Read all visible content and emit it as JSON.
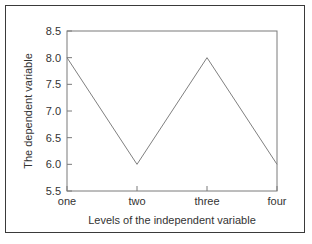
{
  "chart_data": {
    "type": "line",
    "title": "",
    "xlabel": "Levels of the independent variable",
    "ylabel": "The dependent variable",
    "categories": [
      "one",
      "two",
      "three",
      "four"
    ],
    "values": [
      8.0,
      6.0,
      8.0,
      6.0
    ],
    "series": [
      {
        "name": "dependent variable",
        "values": [
          8.0,
          6.0,
          8.0,
          6.0
        ]
      }
    ],
    "ylim": [
      5.5,
      8.5
    ],
    "yticks": [
      5.5,
      6.0,
      6.5,
      7.0,
      7.5,
      8.0,
      8.5
    ],
    "ytick_labels": [
      "5.5",
      "6.0",
      "6.5",
      "7.0",
      "7.5",
      "8.0",
      "8.5"
    ],
    "xtick_labels": [
      "one",
      "two",
      "three",
      "four"
    ],
    "grid": false,
    "legend": false,
    "legend_position": "none",
    "line_color": "#808080",
    "axis_color": "#7a7a7a",
    "text_color": "#333333",
    "background_color": "#ffffff",
    "border_color": "#3a3a3a",
    "markers": false,
    "tick_direction": "in"
  }
}
